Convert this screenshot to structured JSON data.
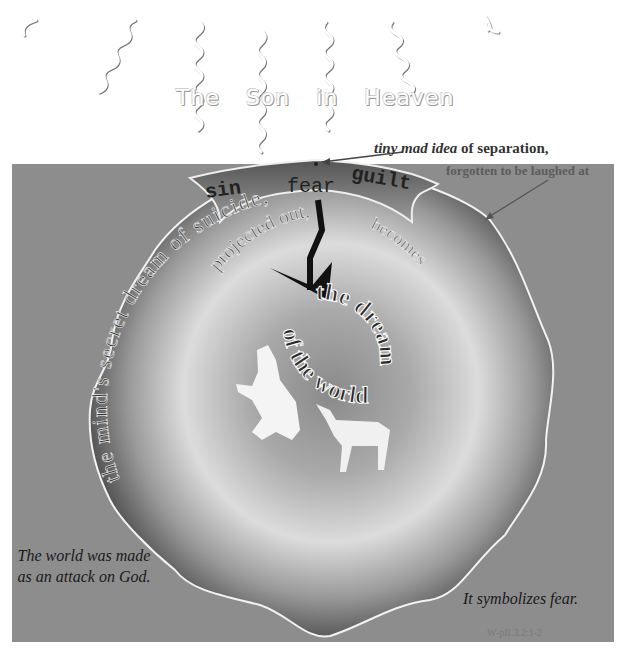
{
  "heaven": {
    "title_words": [
      "The",
      "Son",
      "in",
      "Heaven"
    ]
  },
  "annotations": {
    "origin_italic": "tiny mad idea",
    "origin_rest": " of separation,",
    "origin_sub": "forgotten to be laughed at"
  },
  "banner": {
    "words": [
      "sin",
      "fear",
      "guilt"
    ]
  },
  "arc_text": {
    "outer": "the mind's secret dream of suicide,",
    "inner": "projected out,",
    "becomes": "becomes",
    "center_line1": "the dream",
    "center_line2": "of the world"
  },
  "captions": {
    "left": "The world was made as an attack on God.",
    "right": "It symbolizes fear.",
    "citation": "W-pII.3.2:1-2"
  },
  "colors": {
    "panel": "#8d8d8d",
    "shape_dark": "#2e2e2e",
    "shape_light": "#e6e6e6",
    "outline": "#f2f2f2"
  }
}
